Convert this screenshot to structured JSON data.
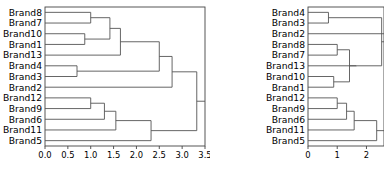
{
  "figure": {
    "type": "dendrogram-pair",
    "background": "#ffffff",
    "line_color": "#555555",
    "axis_color": "#444444",
    "text_color": "#000000"
  },
  "chart_data": [
    {
      "type": "dendrogram",
      "panel": "left",
      "title": "",
      "xlabel": "",
      "ylabel": "",
      "orientation": "right",
      "xlim": [
        0.0,
        3.5
      ],
      "grid": false,
      "legend": null,
      "xticks": [
        0.0,
        0.5,
        1.0,
        1.5,
        2.0,
        2.5,
        3.0,
        3.5
      ],
      "xticklabels": [
        "0.0",
        "0.5",
        "1.0",
        "1.5",
        "2.0",
        "2.5",
        "3.0",
        "3.5"
      ],
      "leaves": [
        "Brand8",
        "Brand7",
        "Brand10",
        "Brand1",
        "Brand13",
        "Brand4",
        "Brand3",
        "Brand2",
        "Brand12",
        "Brand9",
        "Brand6",
        "Brand11",
        "Brand5"
      ],
      "merges": [
        {
          "id": "m1",
          "left": "Brand8",
          "right": "Brand7",
          "height": 1.0
        },
        {
          "id": "m2",
          "left": "Brand10",
          "right": "Brand1",
          "height": 0.87
        },
        {
          "id": "m3",
          "left": "m1",
          "right": "m2",
          "height": 1.42
        },
        {
          "id": "m4",
          "left": "m3",
          "right": "Brand13",
          "height": 1.65
        },
        {
          "id": "m5",
          "left": "Brand4",
          "right": "Brand3",
          "height": 0.7
        },
        {
          "id": "m6",
          "left": "Brand12",
          "right": "Brand9",
          "height": 1.0
        },
        {
          "id": "m7",
          "left": "m6",
          "right": "Brand6",
          "height": 1.3
        },
        {
          "id": "m8",
          "left": "m7",
          "right": "Brand11",
          "height": 1.55
        },
        {
          "id": "m9",
          "left": "m8",
          "right": "Brand5",
          "height": 2.32
        },
        {
          "id": "m10",
          "left": "m4",
          "right": "m5",
          "height": 2.5
        },
        {
          "id": "m11",
          "left": "m10",
          "right": "Brand2",
          "height": 2.78
        },
        {
          "id": "m12",
          "left": "m11",
          "right": "m9",
          "height": 3.32
        }
      ]
    },
    {
      "type": "dendrogram",
      "panel": "right",
      "title": "",
      "xlabel": "",
      "ylabel": "",
      "orientation": "right",
      "xlim": [
        0.0,
        2.6
      ],
      "grid": false,
      "legend": null,
      "xticks": [
        0,
        1,
        2
      ],
      "xticklabels": [
        "0",
        "1",
        "2"
      ],
      "leaves": [
        "Brand4",
        "Brand3",
        "Brand2",
        "Brand8",
        "Brand7",
        "Brand13",
        "Brand10",
        "Brand1",
        "Brand12",
        "Brand9",
        "Brand6",
        "Brand11",
        "Brand5"
      ],
      "merges": [
        {
          "id": "r1",
          "left": "Brand4",
          "right": "Brand3",
          "height": 0.7
        },
        {
          "id": "r2",
          "left": "Brand8",
          "right": "Brand7",
          "height": 1.0
        },
        {
          "id": "r3",
          "left": "Brand10",
          "right": "Brand1",
          "height": 0.88
        },
        {
          "id": "r4",
          "left": "r2",
          "right": "r3",
          "height": 1.42
        },
        {
          "id": "r5",
          "left": "r4",
          "right": "Brand13",
          "height": 1.66
        },
        {
          "id": "r6",
          "left": "Brand12",
          "right": "Brand9",
          "height": 1.0
        },
        {
          "id": "r7",
          "left": "r6",
          "right": "Brand6",
          "height": 1.32
        },
        {
          "id": "r8",
          "left": "r7",
          "right": "Brand11",
          "height": 1.58
        },
        {
          "id": "r9",
          "left": "r8",
          "right": "Brand5",
          "height": 2.35
        },
        {
          "id": "r10",
          "left": "r5",
          "right": "r1",
          "height": 2.52
        }
      ]
    }
  ]
}
